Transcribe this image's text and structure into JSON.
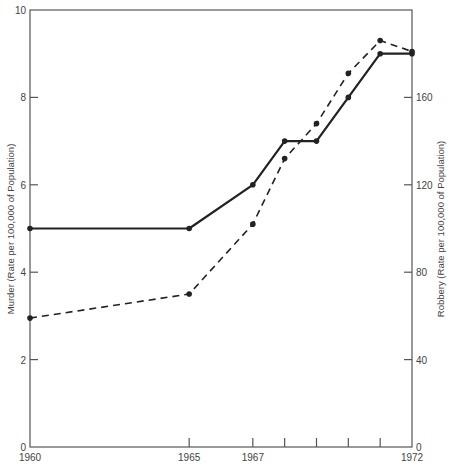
{
  "chart_data": {
    "type": "line",
    "title": "",
    "xlabel": "",
    "ylabel": "Murder (Rate per 100,000 of Population)",
    "ylabel_right": "Robbery (Rate per 100,000 of Population)",
    "x": [
      1960,
      1965,
      1967,
      1968,
      1969,
      1970,
      1971,
      1972
    ],
    "x_tick_labels": [
      "1960",
      "1965",
      "1967",
      "",
      "",
      "",
      "",
      "1972"
    ],
    "ylim": [
      0,
      10
    ],
    "ylim_right": [
      0,
      200
    ],
    "y_ticks": [
      0,
      2,
      4,
      6,
      8,
      10
    ],
    "y_ticks_right": [
      0,
      40,
      80,
      120,
      160
    ],
    "grid": false,
    "legend": null,
    "series": [
      {
        "name": "Murder",
        "axis": "left",
        "style": "solid",
        "values": [
          5.0,
          5.0,
          6.0,
          7.0,
          7.0,
          8.0,
          9.0,
          9.0
        ]
      },
      {
        "name": "Robbery",
        "axis": "right",
        "style": "dashed",
        "values": [
          59,
          70,
          102,
          132,
          148,
          171,
          186,
          181
        ]
      }
    ]
  },
  "colors": {
    "line": "#222222",
    "axis": "#555555",
    "background": "#ffffff"
  }
}
